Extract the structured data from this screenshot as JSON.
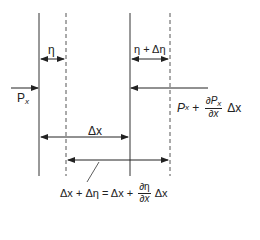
{
  "diagram": {
    "lines": {
      "solid": [
        39,
        130
      ],
      "dashed": [
        66,
        170
      ],
      "top": 13,
      "bottom": 176
    },
    "labels": {
      "eta": "η",
      "eta_plus_deta": "η + Δη",
      "px_left_P": "P",
      "px_left_sub": "x",
      "px_right_P": "P",
      "px_right_sub": "x",
      "px_right_plus": " + ",
      "px_right_frac_num_d": "∂",
      "px_right_frac_num_P": "P",
      "px_right_frac_num_sub": "x",
      "px_right_frac_den": "∂x",
      "px_right_tail": "Δx",
      "delta_x": "Δx",
      "eq_left": "Δx + Δη = Δx + ",
      "eq_frac_num": "∂η",
      "eq_frac_den": "∂x",
      "eq_tail": "Δx"
    },
    "colors": {
      "stroke": "#222222",
      "background": "#ffffff"
    }
  }
}
